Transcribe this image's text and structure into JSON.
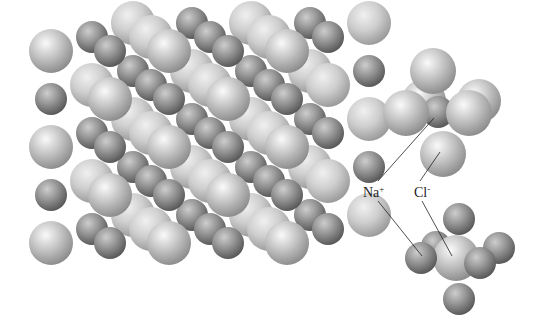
{
  "diagram": {
    "lattice": {
      "name": "nacl-lattice",
      "columns": 5,
      "rows": 5,
      "depth_layers": 3,
      "colors": {
        "cl_fill_light": "#f4f4f4",
        "cl_fill_mid": "#c4c4c4",
        "cl_fill_dark": "#8a8a8a",
        "na_fill_light": "#c8c8c8",
        "na_fill_mid": "#8f8f8f",
        "na_fill_dark": "#5a5a5a"
      }
    },
    "labels": {
      "na": {
        "text": "Na",
        "charge": "+"
      },
      "cl": {
        "text": "Cl",
        "charge": "-"
      }
    },
    "clusters": [
      {
        "name": "na-coordination-cluster",
        "center_ion": "Na+",
        "neighbors": "Cl-",
        "coordination_number": 6
      },
      {
        "name": "cl-coordination-cluster",
        "center_ion": "Cl-",
        "neighbors": "Na+",
        "coordination_number": 6
      }
    ]
  }
}
